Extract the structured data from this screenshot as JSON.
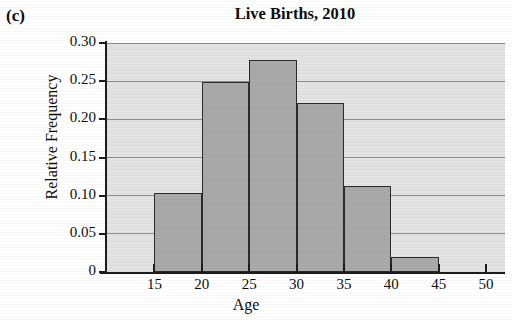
{
  "figure": {
    "panel_label": "(c)",
    "title": "Live Births, 2010"
  },
  "axes": {
    "ylabel": "Relative Frequency",
    "xlabel": "Age",
    "ytick_labels": [
      "0",
      "0.05",
      "0.10",
      "0.15",
      "0.20",
      "0.25",
      "0.30"
    ],
    "xtick_labels": [
      "15",
      "20",
      "25",
      "30",
      "35",
      "40",
      "45",
      "50"
    ]
  },
  "colors": {
    "plot_background": "#e3e3e1",
    "bar_fill": "#a9a9a7",
    "bar_border": "#2b2b2b",
    "gridline": "#8d8d8d",
    "axis": "#1c1c1c",
    "text": "#0d0d0d"
  },
  "chart_data": {
    "type": "bar",
    "title": "Live Births, 2010",
    "xlabel": "Age",
    "ylabel": "Relative Frequency",
    "grid": true,
    "legend": "none",
    "xlim": [
      10,
      52
    ],
    "ylim": [
      0,
      0.3
    ],
    "xticks": [
      15,
      20,
      25,
      30,
      35,
      40,
      45,
      50
    ],
    "yticks": [
      0,
      0.05,
      0.1,
      0.15,
      0.2,
      0.25,
      0.3
    ],
    "bin_width": 5,
    "categories": [
      "15-20",
      "20-25",
      "25-30",
      "30-35",
      "35-40",
      "40-45"
    ],
    "bin_edges": [
      15,
      20,
      25,
      30,
      35,
      40,
      45
    ],
    "values": [
      0.103,
      0.249,
      0.278,
      0.221,
      0.113,
      0.019
    ]
  }
}
